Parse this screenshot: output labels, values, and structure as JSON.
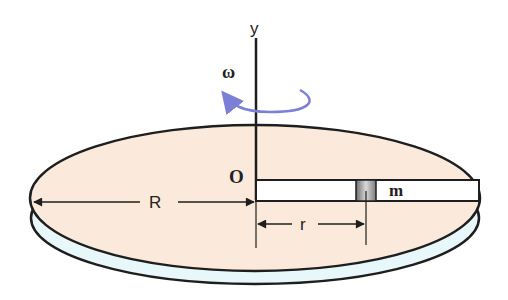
{
  "diagram": {
    "labels": {
      "axis": "y",
      "omega": "ω",
      "origin": "O",
      "radius": "R",
      "mass_radius": "r",
      "mass": "m"
    },
    "colors": {
      "disc_top": "#fbeadb",
      "disc_rim": "#e8f7f9",
      "outline": "#1e1e1e",
      "rotation_arrow": "#7b7fd6",
      "track_fill": "#ffffff",
      "mass_block": "#9a9a9a"
    }
  }
}
